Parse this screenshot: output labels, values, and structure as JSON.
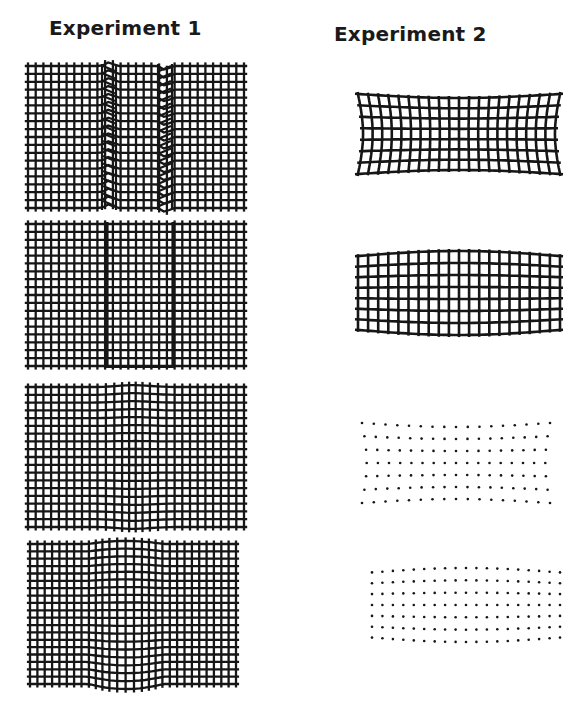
{
  "figure": {
    "columns": [
      {
        "title": "Experiment 1"
      },
      {
        "title": "Experiment 2"
      }
    ],
    "colors": {
      "ink": "#161616",
      "background": "#ffffff"
    },
    "experiment1_panels": [
      {
        "id": "e1p1",
        "style": "grid",
        "x": 24,
        "y": 62,
        "w": 224,
        "h": 150,
        "cols": 28,
        "rows": 18,
        "deformation": "offset-block-with-sheared-bands",
        "zones": [
          [
            78,
            92
          ],
          [
            134,
            148
          ]
        ]
      },
      {
        "id": "e1p2",
        "style": "grid",
        "x": 24,
        "y": 220,
        "w": 224,
        "h": 150,
        "cols": 28,
        "rows": 18,
        "deformation": "offset-block-with-fault-lines",
        "zones": [
          [
            82,
            84
          ],
          [
            148,
            150
          ]
        ]
      },
      {
        "id": "e1p3",
        "style": "grid",
        "x": 24,
        "y": 383,
        "w": 224,
        "h": 148,
        "cols": 28,
        "rows": 18,
        "deformation": "central-constriction",
        "zones": [
          [
            70,
            150
          ]
        ]
      },
      {
        "id": "e1p4",
        "style": "grid",
        "x": 26,
        "y": 540,
        "w": 214,
        "h": 148,
        "cols": 28,
        "rows": 19,
        "deformation": "central-bulge",
        "zones": [
          [
            62,
            138
          ]
        ]
      }
    ],
    "experiment2_panels": [
      {
        "id": "e2p1",
        "style": "grid",
        "x": 354,
        "y": 90,
        "w": 210,
        "h": 88,
        "cols": 20,
        "rows": 7,
        "deformation": "concave-top-and-bottom"
      },
      {
        "id": "e2p2",
        "style": "grid",
        "x": 354,
        "y": 247,
        "w": 210,
        "h": 92,
        "cols": 20,
        "rows": 7,
        "deformation": "convex-barrel"
      },
      {
        "id": "e2p3",
        "style": "dots",
        "x": 358,
        "y": 419,
        "w": 196,
        "h": 88,
        "cols": 17,
        "rows": 7,
        "deformation": "concave-top-and-bottom"
      },
      {
        "id": "e2p4",
        "style": "dots",
        "x": 368,
        "y": 564,
        "w": 196,
        "h": 82,
        "cols": 19,
        "rows": 7,
        "deformation": "convex-barrel"
      }
    ]
  }
}
